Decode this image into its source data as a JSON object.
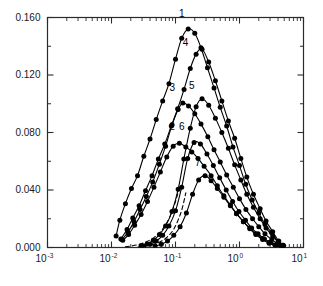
{
  "chart_data": {
    "type": "line",
    "title": "",
    "xlabel": "",
    "ylabel": "",
    "xscale": "log",
    "yscale": "linear",
    "xlim": [
      0.001,
      10
    ],
    "ylim": [
      0.0,
      0.16
    ],
    "grid": false,
    "legend": "inline-curve-numbers",
    "yticks": [
      0.0,
      0.04,
      0.08,
      0.12,
      0.16
    ],
    "ytick_labels": [
      "0.000",
      "0.040",
      "0.080",
      "0.120",
      "0.160"
    ],
    "yminor_ticks": [
      0.02,
      0.06,
      0.1,
      0.14
    ],
    "xticks": [
      0.001,
      0.01,
      0.1,
      1,
      10
    ],
    "xtick_labels": [
      "10-3",
      "10-2",
      "10-1",
      "100",
      "101"
    ],
    "xtick_mantissas": [
      "10",
      "10",
      "10",
      "10",
      "10"
    ],
    "xtick_exponents": [
      "-3",
      "-2",
      "-1",
      "0",
      "1"
    ],
    "markers": "filled-circle",
    "series": [
      {
        "name": "1",
        "label": "1",
        "style": "solid",
        "label_x": 0.125,
        "label_y": 0.1605,
        "x": [
          0.0118,
          0.0135,
          0.0165,
          0.0205,
          0.0255,
          0.032,
          0.04,
          0.05,
          0.063,
          0.079,
          0.1,
          0.125,
          0.158,
          0.2,
          0.25,
          0.316,
          0.4,
          0.5,
          0.63,
          0.79,
          1.0,
          1.25,
          1.58,
          2.0,
          2.5,
          3.16,
          4.0,
          4.7
        ],
        "y": [
          0.008,
          0.019,
          0.0305,
          0.041,
          0.05,
          0.0635,
          0.0755,
          0.089,
          0.102,
          0.114,
          0.131,
          0.1455,
          0.152,
          0.149,
          0.139,
          0.125,
          0.111,
          0.0975,
          0.0845,
          0.07,
          0.057,
          0.044,
          0.033,
          0.024,
          0.016,
          0.0105,
          0.004,
          0.0015
        ]
      },
      {
        "name": "4",
        "label": "4",
        "style": "solid",
        "label_x": 0.143,
        "label_y": 0.14,
        "x": [
          0.014,
          0.0175,
          0.0215,
          0.027,
          0.034,
          0.043,
          0.054,
          0.068,
          0.086,
          0.108,
          0.136,
          0.17,
          0.21,
          0.26,
          0.33,
          0.42,
          0.53,
          0.67,
          0.84,
          1.05,
          1.3,
          1.65,
          2.1,
          2.6,
          3.3,
          4.1,
          4.8
        ],
        "y": [
          0.006,
          0.0125,
          0.0205,
          0.029,
          0.0395,
          0.05,
          0.0615,
          0.072,
          0.0845,
          0.0965,
          0.11,
          0.1245,
          0.1345,
          0.138,
          0.129,
          0.116,
          0.102,
          0.088,
          0.076,
          0.062,
          0.049,
          0.037,
          0.027,
          0.0185,
          0.011,
          0.0045,
          0.0015
        ]
      },
      {
        "name": "3",
        "label": "3",
        "style": "solid",
        "label_x": 0.089,
        "label_y": 0.109,
        "x": [
          0.0145,
          0.018,
          0.0225,
          0.028,
          0.035,
          0.044,
          0.056,
          0.07,
          0.088,
          0.11,
          0.13,
          0.16,
          0.2,
          0.25,
          0.32,
          0.4,
          0.5,
          0.63,
          0.8,
          1.0,
          1.26,
          1.6,
          2.0,
          2.5,
          3.2,
          4.0,
          4.8
        ],
        "y": [
          0.0055,
          0.0105,
          0.018,
          0.0265,
          0.0355,
          0.0455,
          0.058,
          0.0705,
          0.085,
          0.096,
          0.1005,
          0.0985,
          0.093,
          0.086,
          0.077,
          0.068,
          0.0595,
          0.0505,
          0.042,
          0.034,
          0.0265,
          0.02,
          0.0145,
          0.0095,
          0.0055,
          0.0025,
          0.0012
        ]
      },
      {
        "name": "5",
        "label": "5",
        "style": "solid",
        "label_x": 0.18,
        "label_y": 0.1105,
        "x": [
          0.029,
          0.036,
          0.045,
          0.056,
          0.07,
          0.088,
          0.11,
          0.135,
          0.17,
          0.21,
          0.26,
          0.33,
          0.42,
          0.53,
          0.67,
          0.84,
          1.05,
          1.3,
          1.65,
          2.1,
          2.6,
          3.3,
          4.1,
          4.9
        ],
        "y": [
          0.0012,
          0.0025,
          0.005,
          0.009,
          0.015,
          0.025,
          0.0405,
          0.0615,
          0.083,
          0.098,
          0.1035,
          0.099,
          0.09,
          0.08,
          0.069,
          0.0575,
          0.047,
          0.037,
          0.028,
          0.02,
          0.0135,
          0.008,
          0.0035,
          0.0013
        ]
      },
      {
        "name": "2",
        "label": "2",
        "style": "solid",
        "label_x": 0.088,
        "label_y": 0.082,
        "x": [
          0.015,
          0.0185,
          0.023,
          0.029,
          0.0365,
          0.046,
          0.058,
          0.073,
          0.092,
          0.115,
          0.145,
          0.18,
          0.225,
          0.28,
          0.36,
          0.45,
          0.57,
          0.72,
          0.9,
          1.15,
          1.45,
          1.8,
          2.3,
          2.9,
          3.6,
          4.5
        ],
        "y": [
          0.005,
          0.009,
          0.0155,
          0.023,
          0.032,
          0.042,
          0.0525,
          0.063,
          0.0705,
          0.0725,
          0.07,
          0.0665,
          0.062,
          0.0565,
          0.05,
          0.043,
          0.036,
          0.0295,
          0.0235,
          0.018,
          0.013,
          0.009,
          0.0055,
          0.003,
          0.0015,
          0.0008
        ]
      },
      {
        "name": "6",
        "label": "6",
        "style": "solid",
        "label_x": 0.125,
        "label_y": 0.082,
        "x": [
          0.032,
          0.04,
          0.05,
          0.063,
          0.079,
          0.1,
          0.125,
          0.155,
          0.195,
          0.245,
          0.31,
          0.39,
          0.49,
          0.62,
          0.78,
          0.98,
          1.24,
          1.55,
          1.95,
          2.45,
          3.1,
          3.9,
          4.8
        ],
        "y": [
          0.001,
          0.0022,
          0.0045,
          0.0085,
          0.015,
          0.0255,
          0.042,
          0.062,
          0.073,
          0.072,
          0.065,
          0.057,
          0.0485,
          0.04,
          0.032,
          0.025,
          0.019,
          0.0135,
          0.0095,
          0.006,
          0.0035,
          0.0018,
          0.001
        ]
      },
      {
        "name": "7",
        "label": "7",
        "style": "solid",
        "label_x": 0.222,
        "label_y": 0.057,
        "x": [
          0.048,
          0.06,
          0.075,
          0.094,
          0.118,
          0.148,
          0.185,
          0.23,
          0.29,
          0.36,
          0.45,
          0.57,
          0.72,
          0.9,
          1.15,
          1.45,
          1.8,
          2.3,
          2.9,
          3.6,
          4.5
        ],
        "y": [
          0.001,
          0.0022,
          0.0045,
          0.0085,
          0.0145,
          0.024,
          0.037,
          0.047,
          0.05,
          0.0465,
          0.041,
          0.035,
          0.029,
          0.0235,
          0.018,
          0.0135,
          0.0095,
          0.0062,
          0.0035,
          0.0018,
          0.001
        ]
      },
      {
        "name": "dashed-a",
        "label": "",
        "style": "dashed",
        "x": [
          0.0165,
          0.0215,
          0.028,
          0.036,
          0.047,
          0.061,
          0.079,
          0.1,
          0.115
        ],
        "y": [
          0.0005,
          0.0012,
          0.0024,
          0.0042,
          0.0072,
          0.012,
          0.02,
          0.032,
          0.042
        ]
      },
      {
        "name": "dashed-b",
        "label": "",
        "style": "dashed",
        "x": [
          0.026,
          0.034,
          0.044,
          0.057,
          0.074,
          0.096,
          0.123,
          0.145
        ],
        "y": [
          0.0004,
          0.001,
          0.002,
          0.0038,
          0.0072,
          0.0135,
          0.025,
          0.038
        ]
      }
    ]
  },
  "axes": {
    "y_tick_labels": [
      "0.160",
      "0.120",
      "0.080",
      "0.040",
      "0.000"
    ],
    "x_tick_mantissa": "10",
    "x_tick_exponents": [
      "-3",
      "-2",
      "-1",
      "0",
      "1"
    ]
  }
}
